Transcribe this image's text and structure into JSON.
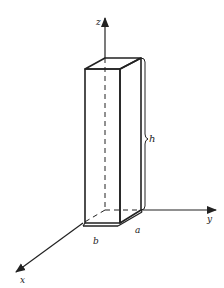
{
  "figure": {
    "axes": {
      "z": "z",
      "y": "y",
      "x": "x"
    },
    "dimensions": {
      "height": "h",
      "width_b": "b",
      "depth_a": "a"
    },
    "colors": {
      "stroke": "#222222",
      "background": "#ffffff"
    }
  }
}
